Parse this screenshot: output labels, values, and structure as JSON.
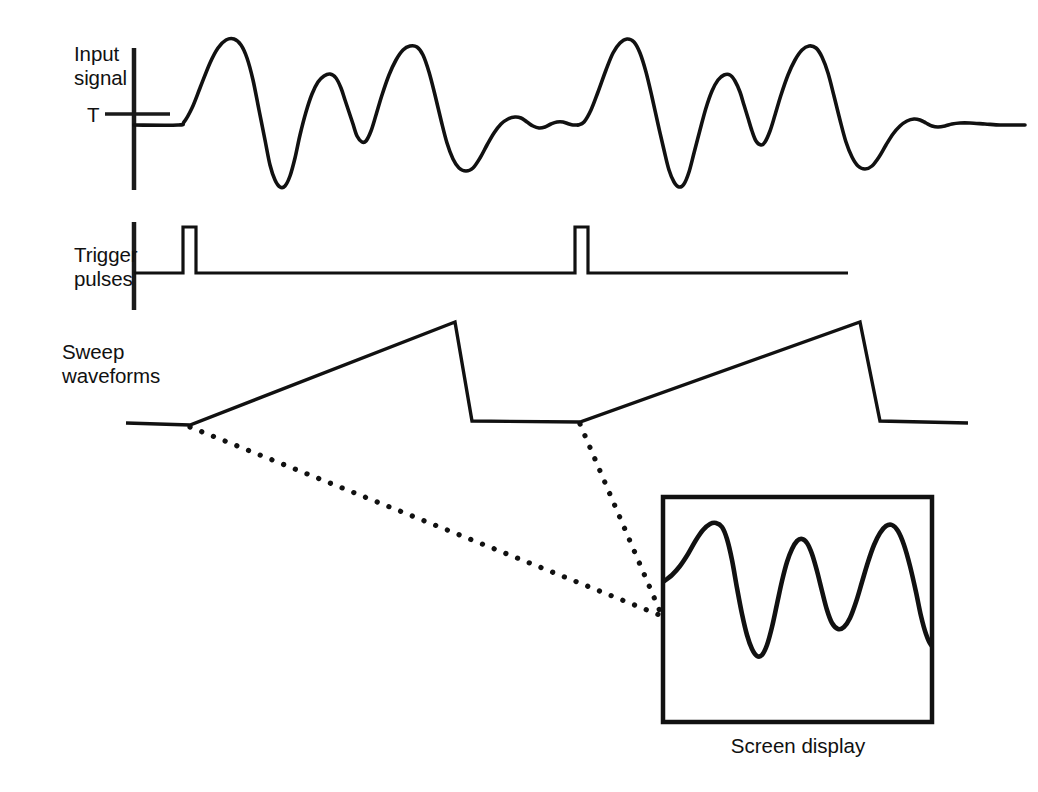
{
  "figure": {
    "background_color": "#ffffff",
    "trace_color": "#111111"
  },
  "labels": {
    "input_signal": "Input\nsignal",
    "threshold_marker": "T",
    "trigger_pulses": "Trigger\npulses",
    "sweep_waveforms": "Sweep\nwaveforms",
    "screen_display": "Screen display"
  },
  "chart_data": {
    "type": "line",
    "xlabel": "",
    "ylabel": "",
    "grid": false,
    "legend": null,
    "panels": [
      {
        "name": "input-signal",
        "label": "Input signal",
        "axis": {
          "x": 134,
          "y_top": 48,
          "y_bottom": 190
        },
        "baseline_y": 125,
        "threshold": {
          "label": "T",
          "y": 114,
          "x_start": 105,
          "x_end": 170
        },
        "series": [
          {
            "name": "input-waveform",
            "points": [
              [
                134,
                125
              ],
              [
                178,
                125
              ],
              [
                184,
                122
              ],
              [
                192,
                108
              ],
              [
                200,
                88
              ],
              [
                210,
                63
              ],
              [
                218,
                48
              ],
              [
                226,
                40
              ],
              [
                234,
                39
              ],
              [
                241,
                45
              ],
              [
                247,
                58
              ],
              [
                253,
                80
              ],
              [
                259,
                110
              ],
              [
                265,
                140
              ],
              [
                270,
                165
              ],
              [
                275,
                180
              ],
              [
                280,
                187
              ],
              [
                285,
                186
              ],
              [
                290,
                176
              ],
              [
                295,
                158
              ],
              [
                300,
                135
              ],
              [
                306,
                112
              ],
              [
                312,
                94
              ],
              [
                318,
                82
              ],
              [
                324,
                76
              ],
              [
                330,
                74
              ],
              [
                336,
                78
              ],
              [
                341,
                88
              ],
              [
                345,
                100
              ],
              [
                349,
                112
              ],
              [
                353,
                124
              ],
              [
                357,
                136
              ],
              [
                362,
                142
              ],
              [
                366,
                141
              ],
              [
                371,
                131
              ],
              [
                376,
                115
              ],
              [
                382,
                95
              ],
              [
                389,
                75
              ],
              [
                396,
                60
              ],
              [
                403,
                50
              ],
              [
                410,
                46
              ],
              [
                417,
                47
              ],
              [
                423,
                55
              ],
              [
                429,
                72
              ],
              [
                435,
                95
              ],
              [
                441,
                120
              ],
              [
                447,
                143
              ],
              [
                453,
                159
              ],
              [
                459,
                168
              ],
              [
                466,
                171
              ],
              [
                473,
                168
              ],
              [
                480,
                158
              ],
              [
                487,
                145
              ],
              [
                494,
                133
              ],
              [
                501,
                124
              ],
              [
                508,
                119
              ],
              [
                515,
                117
              ],
              [
                521,
                118
              ],
              [
                527,
                122
              ],
              [
                533,
                126
              ],
              [
                539,
                128
              ],
              [
                545,
                127
              ],
              [
                551,
                124
              ],
              [
                557,
                122
              ],
              [
                563,
                122
              ],
              [
                569,
                124
              ],
              [
                573,
                125
              ],
              [
                578,
                125
              ]
            ]
          },
          {
            "name": "input-waveform-repeat",
            "points": [
              [
                578,
                125
              ],
              [
                584,
                122
              ],
              [
                591,
                110
              ],
              [
                598,
                92
              ],
              [
                606,
                70
              ],
              [
                613,
                53
              ],
              [
                620,
                43
              ],
              [
                627,
                39
              ],
              [
                634,
                42
              ],
              [
                640,
                53
              ],
              [
                646,
                72
              ],
              [
                652,
                97
              ],
              [
                658,
                124
              ],
              [
                664,
                150
              ],
              [
                669,
                170
              ],
              [
                674,
                182
              ],
              [
                679,
                187
              ],
              [
                684,
                184
              ],
              [
                689,
                172
              ],
              [
                694,
                153
              ],
              [
                700,
                130
              ],
              [
                706,
                108
              ],
              [
                712,
                91
              ],
              [
                718,
                80
              ],
              [
                724,
                75
              ],
              [
                730,
                75
              ],
              [
                735,
                81
              ],
              [
                740,
                92
              ],
              [
                744,
                105
              ],
              [
                748,
                118
              ],
              [
                752,
                131
              ],
              [
                756,
                141
              ],
              [
                761,
                145
              ],
              [
                765,
                142
              ],
              [
                770,
                131
              ],
              [
                775,
                115
              ],
              [
                781,
                95
              ],
              [
                788,
                75
              ],
              [
                795,
                60
              ],
              [
                802,
                50
              ],
              [
                809,
                46
              ],
              [
                816,
                48
              ],
              [
                822,
                57
              ],
              [
                828,
                73
              ],
              [
                834,
                96
              ],
              [
                840,
                120
              ],
              [
                846,
                142
              ],
              [
                852,
                157
              ],
              [
                858,
                166
              ],
              [
                865,
                169
              ],
              [
                872,
                166
              ],
              [
                879,
                157
              ],
              [
                886,
                145
              ],
              [
                893,
                134
              ],
              [
                900,
                126
              ],
              [
                907,
                121
              ],
              [
                914,
                119
              ],
              [
                920,
                120
              ],
              [
                926,
                123
              ],
              [
                932,
                126
              ],
              [
                938,
                127
              ],
              [
                945,
                126
              ],
              [
                952,
                124
              ],
              [
                960,
                123
              ],
              [
                970,
                123
              ],
              [
                985,
                124
              ],
              [
                1000,
                125
              ],
              [
                1012,
                125
              ],
              [
                1025,
                125
              ]
            ]
          }
        ]
      },
      {
        "name": "trigger-pulses",
        "label": "Trigger pulses",
        "axis": {
          "x": 134,
          "y_top": 222,
          "y_bottom": 310
        },
        "baseline_y": 273,
        "baseline_x_start": 134,
        "baseline_x_end": 848,
        "pulse_top_y": 227,
        "pulses": [
          {
            "x_start": 183,
            "x_end": 196
          },
          {
            "x_start": 575,
            "x_end": 588
          }
        ]
      },
      {
        "name": "sweep-waveforms",
        "label": "Sweep waveforms",
        "baseline_y": 423,
        "x_start": 126,
        "x_end": 968,
        "ramps": [
          {
            "start_x": 190,
            "start_y": 425,
            "peak_x": 455,
            "peak_y": 322,
            "retrace_end_x": 472,
            "retrace_end_y": 421
          },
          {
            "start_x": 580,
            "start_y": 422,
            "peak_x": 860,
            "peak_y": 322,
            "retrace_end_x": 880,
            "retrace_end_y": 421
          }
        ]
      }
    ],
    "projection_lines": [
      {
        "name": "projection-left",
        "from": [
          190,
          427
        ],
        "to": [
          662,
          616
        ]
      },
      {
        "name": "projection-right",
        "from": [
          580,
          424
        ],
        "to": [
          662,
          616
        ]
      }
    ],
    "screen_display": {
      "name": "screen-display",
      "caption": "Screen display",
      "box": {
        "x": 663,
        "y": 497,
        "width": 269,
        "height": 225
      },
      "series": [
        {
          "name": "screen-waveform",
          "points": [
            [
              663,
              582
            ],
            [
              672,
              575
            ],
            [
              680,
              566
            ],
            [
              688,
              554
            ],
            [
              696,
              540
            ],
            [
              703,
              530
            ],
            [
              710,
              524
            ],
            [
              716,
              523
            ],
            [
              722,
              527
            ],
            [
              727,
              539
            ],
            [
              732,
              560
            ],
            [
              737,
              588
            ],
            [
              742,
              614
            ],
            [
              747,
              635
            ],
            [
              752,
              649
            ],
            [
              757,
              656
            ],
            [
              762,
              655
            ],
            [
              767,
              645
            ],
            [
              772,
              627
            ],
            [
              777,
              604
            ],
            [
              782,
              581
            ],
            [
              787,
              562
            ],
            [
              792,
              549
            ],
            [
              797,
              541
            ],
            [
              802,
              539
            ],
            [
              807,
              543
            ],
            [
              812,
              554
            ],
            [
              817,
              571
            ],
            [
              822,
              591
            ],
            [
              827,
              610
            ],
            [
              832,
              623
            ],
            [
              838,
              629
            ],
            [
              844,
              627
            ],
            [
              850,
              618
            ],
            [
              856,
              602
            ],
            [
              862,
              582
            ],
            [
              868,
              562
            ],
            [
              874,
              545
            ],
            [
              880,
              533
            ],
            [
              886,
              526
            ],
            [
              892,
              525
            ],
            [
              898,
              531
            ],
            [
              904,
              545
            ],
            [
              910,
              566
            ],
            [
              916,
              592
            ],
            [
              921,
              616
            ],
            [
              926,
              634
            ],
            [
              931,
              645
            ],
            [
              936,
              648
            ],
            [
              941,
              643
            ],
            [
              946,
              632
            ],
            [
              951,
              618
            ],
            [
              956,
              604
            ],
            [
              961,
              593
            ],
            [
              966,
              586
            ],
            [
              971,
              582
            ],
            [
              976,
              581
            ],
            [
              981,
              582
            ],
            [
              986,
              583
            ],
            [
              991,
              584
            ],
            [
              996,
              585
            ],
            [
              1001,
              587
            ],
            [
              1006,
              590
            ],
            [
              1011,
              595
            ],
            [
              1016,
              599
            ],
            [
              1021,
              602
            ]
          ]
        }
      ]
    }
  }
}
